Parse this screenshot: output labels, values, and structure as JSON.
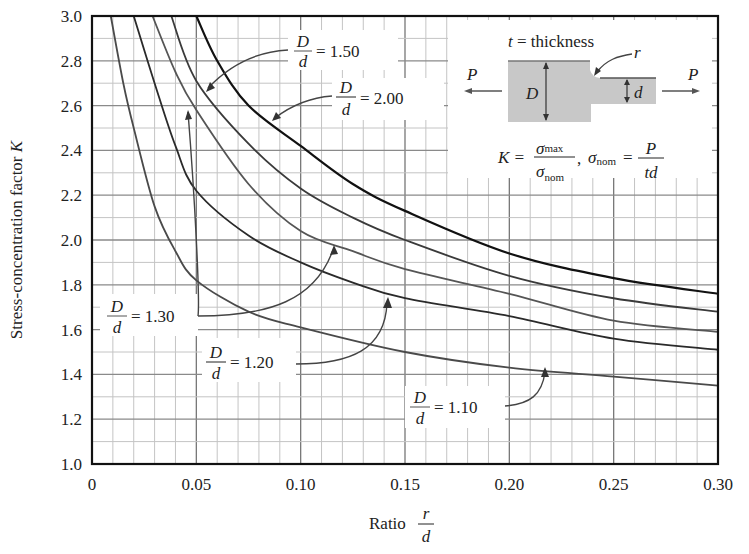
{
  "chart_data": {
    "type": "line",
    "title": "",
    "xlabel": "Ratio r/d",
    "ylabel": "Stress-concentration factor K",
    "xlim": [
      0,
      0.3
    ],
    "ylim": [
      1.0,
      3.0
    ],
    "x_ticks": [
      "0",
      "0.05",
      "0.10",
      "0.15",
      "0.20",
      "0.25",
      "0.30"
    ],
    "y_ticks": [
      "1.0",
      "1.2",
      "1.4",
      "1.6",
      "1.8",
      "2.0",
      "2.2",
      "2.4",
      "2.6",
      "2.8",
      "3.0"
    ],
    "grid": true,
    "series": [
      {
        "name": "D/d = 2.00",
        "x": [
          0.05,
          0.06,
          0.075,
          0.1,
          0.125,
          0.15,
          0.2,
          0.25,
          0.3
        ],
        "values": [
          3.0,
          2.8,
          2.6,
          2.42,
          2.25,
          2.13,
          1.94,
          1.83,
          1.76
        ]
      },
      {
        "name": "D/d = 1.50",
        "x": [
          0.038,
          0.05,
          0.075,
          0.1,
          0.125,
          0.15,
          0.2,
          0.25,
          0.3
        ],
        "values": [
          3.0,
          2.71,
          2.43,
          2.23,
          2.1,
          2.0,
          1.84,
          1.74,
          1.68
        ]
      },
      {
        "name": "D/d = 1.30",
        "x": [
          0.029,
          0.04,
          0.05,
          0.075,
          0.1,
          0.125,
          0.15,
          0.2,
          0.25,
          0.3
        ],
        "values": [
          3.0,
          2.75,
          2.58,
          2.25,
          2.04,
          1.95,
          1.87,
          1.76,
          1.64,
          1.59
        ]
      },
      {
        "name": "D/d = 1.20",
        "x": [
          0.02,
          0.03,
          0.04,
          0.05,
          0.075,
          0.1,
          0.125,
          0.15,
          0.2,
          0.25,
          0.3
        ],
        "values": [
          3.0,
          2.7,
          2.42,
          2.22,
          2.02,
          1.9,
          1.81,
          1.74,
          1.66,
          1.56,
          1.51
        ]
      },
      {
        "name": "D/d = 1.10",
        "x": [
          0.009,
          0.015,
          0.02,
          0.03,
          0.04,
          0.05,
          0.075,
          0.1,
          0.15,
          0.2,
          0.25,
          0.3
        ],
        "values": [
          3.0,
          2.7,
          2.5,
          2.15,
          1.95,
          1.82,
          1.68,
          1.61,
          1.5,
          1.43,
          1.39,
          1.35
        ]
      }
    ],
    "annotations": [
      "t = thickness",
      "K = σmax / σnom, σnom = P / (t d)"
    ]
  },
  "axes": {
    "ylabel_text": "Stress-concentration factor ",
    "ylabel_var": "K",
    "xlabel_text": "Ratio",
    "xlabel_num": "r",
    "xlabel_den": "d"
  },
  "labels": {
    "d200": {
      "num": "D",
      "den": "d",
      "eq": "= 2.00"
    },
    "d150": {
      "num": "D",
      "den": "d",
      "eq": "= 1.50"
    },
    "d130": {
      "num": "D",
      "den": "d",
      "eq": "= 1.30"
    },
    "d120": {
      "num": "D",
      "den": "d",
      "eq": "= 1.20"
    },
    "d110": {
      "num": "D",
      "den": "d",
      "eq": "= 1.10"
    }
  },
  "inset": {
    "thickness_var": "t",
    "thickness_text": "= thickness",
    "r": "r",
    "P_left": "P",
    "P_right": "P",
    "D": "D",
    "d": "d",
    "formula_K": "K =",
    "sigma_max_sub": "max",
    "sigma_nom_sub": "nom",
    "sigma": "σ",
    "eq": "=",
    "P": "P",
    "td": "td",
    "comma": ","
  }
}
